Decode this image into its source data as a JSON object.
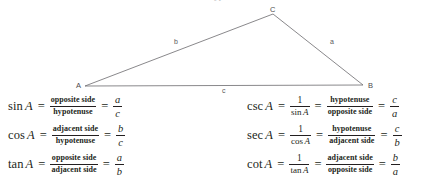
{
  "top_fragment": "hyp",
  "diagram": {
    "name": "right-triangle-labeled",
    "vertices": [
      {
        "id": "A",
        "label": "A",
        "x": 85,
        "y": 86
      },
      {
        "id": "B",
        "label": "B",
        "x": 363,
        "y": 85
      },
      {
        "id": "C",
        "label": "C",
        "x": 273,
        "y": 14
      }
    ],
    "sides": [
      {
        "id": "a",
        "label": "a",
        "between": "C-B"
      },
      {
        "id": "b",
        "label": "b",
        "between": "A-C"
      },
      {
        "id": "c",
        "label": "c",
        "between": "A-B"
      }
    ],
    "line_color": "#6b6a6d",
    "line_width": 0.8
  },
  "formulas": {
    "left": [
      {
        "fn": "sin",
        "arg": "A",
        "eq1": "=",
        "ratio_words": {
          "numerator": "opposite side",
          "denominator": "hypotenuse"
        },
        "eq2": "=",
        "ratio_letters": {
          "numerator": "a",
          "denominator": "c"
        }
      },
      {
        "fn": "cos",
        "arg": "A",
        "eq1": "=",
        "ratio_words": {
          "numerator": "adjacent side",
          "denominator": "hypotenuse"
        },
        "eq2": "=",
        "ratio_letters": {
          "numerator": "b",
          "denominator": "c"
        }
      },
      {
        "fn": "tan",
        "arg": "A",
        "eq1": "=",
        "ratio_words": {
          "numerator": "opposite side",
          "denominator": "adjacent side"
        },
        "eq2": "=",
        "ratio_letters": {
          "numerator": "a",
          "denominator": "b"
        }
      }
    ],
    "right": [
      {
        "fn": "csc",
        "arg": "A",
        "eq1": "=",
        "reciprocal": {
          "numerator": "1",
          "denominator_fn": "sin",
          "denominator_arg": "A"
        },
        "eq2": "=",
        "ratio_words": {
          "numerator": "hypotenuse",
          "denominator": "opposite side"
        },
        "eq3": "=",
        "ratio_letters": {
          "numerator": "c",
          "denominator": "a"
        }
      },
      {
        "fn": "sec",
        "arg": "A",
        "eq1": "=",
        "reciprocal": {
          "numerator": "1",
          "denominator_fn": "cos",
          "denominator_arg": "A"
        },
        "eq2": "=",
        "ratio_words": {
          "numerator": "hypotenuse",
          "denominator": "adjacent side"
        },
        "eq3": "=",
        "ratio_letters": {
          "numerator": "c",
          "denominator": "b"
        }
      },
      {
        "fn": "cot",
        "arg": "A",
        "eq1": "=",
        "reciprocal": {
          "numerator": "1",
          "denominator_fn": "tan",
          "denominator_arg": "A"
        },
        "eq2": "=",
        "ratio_words": {
          "numerator": "adjacent side",
          "denominator": "opposite side"
        },
        "eq3": "=",
        "ratio_letters": {
          "numerator": "b",
          "denominator": "a"
        }
      }
    ]
  },
  "colors": {
    "background": "#ffffff",
    "text": "#231f20",
    "diagram_line": "#6b6a6d",
    "diagram_label": "#4c4a4d"
  }
}
